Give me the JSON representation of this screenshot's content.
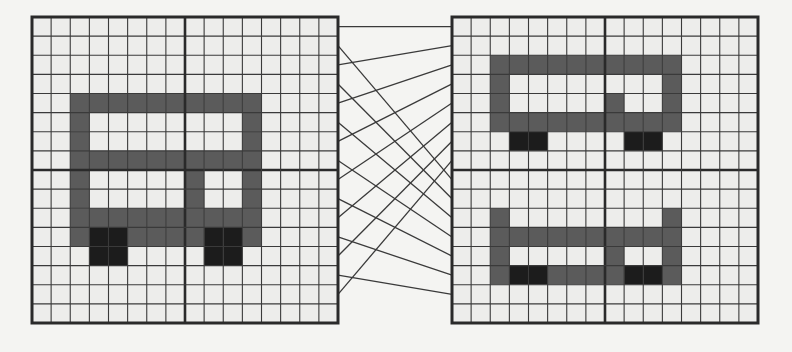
{
  "diagram": {
    "grid_size": 16,
    "quadrant_size": 8,
    "colors": {
      "background": "#f4f4f2",
      "light_cell": "#ededeb",
      "gray_cell": "#5b5b5b",
      "black_cell": "#1c1c1c",
      "grid_line": "#3a3a3a",
      "border": "#2a2a2a",
      "connector": "#3a3a3a"
    },
    "legend": {
      ".": "light",
      "g": "gray",
      "b": "black"
    },
    "left_grid": {
      "x": 32,
      "y": 17,
      "size": 306,
      "rows": [
        "................",
        "................",
        "................",
        "................",
        "..gggggggggg....",
        "..g........g....",
        "..g........g....",
        "..gggggggggg....",
        "..g.....g..g....",
        "..g.....g..g....",
        "..gggggggggg....",
        "..gbbggggbbg....",
        "...bb....bb.....",
        "................",
        "................",
        "................"
      ]
    },
    "right_grid": {
      "x": 452,
      "y": 17,
      "size": 306,
      "rows": [
        "................",
        "................",
        "..gggggggggg....",
        "..g........g....",
        "..g.....g..g....",
        "..gggggggggg....",
        "...bb....bb.....",
        "................",
        "................",
        "................",
        "..g........g....",
        "..gggggggggg....",
        "..g.....g..g....",
        "..gbbggggbbg....",
        "................",
        "................"
      ]
    },
    "connections": [
      {
        "from_row": 0,
        "to_row": 0
      },
      {
        "from_row": 1,
        "to_row": 8
      },
      {
        "from_row": 2,
        "to_row": 1
      },
      {
        "from_row": 3,
        "to_row": 9
      },
      {
        "from_row": 4,
        "to_row": 2
      },
      {
        "from_row": 5,
        "to_row": 10
      },
      {
        "from_row": 6,
        "to_row": 3
      },
      {
        "from_row": 7,
        "to_row": 11
      },
      {
        "from_row": 8,
        "to_row": 4
      },
      {
        "from_row": 9,
        "to_row": 12
      },
      {
        "from_row": 10,
        "to_row": 5
      },
      {
        "from_row": 11,
        "to_row": 13
      },
      {
        "from_row": 12,
        "to_row": 6
      },
      {
        "from_row": 13,
        "to_row": 14
      },
      {
        "from_row": 14,
        "to_row": 7
      }
    ]
  }
}
